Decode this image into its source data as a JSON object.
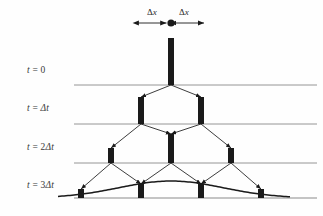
{
  "figure": {
    "kind": "random-walk-binomial-diagram",
    "background_color": "#fefefe",
    "ink_color": "#1a1a1a",
    "gridline_color": "#8a8a8a",
    "label_color": "#3a3a3a"
  },
  "spacing_labels": {
    "left": "Δx",
    "right": "Δx",
    "origin_marker": "filled-dot"
  },
  "time_labels": [
    {
      "id": "t0",
      "text": "t = 0",
      "x": 27,
      "y": 65
    },
    {
      "id": "t1",
      "text": "t = Δt",
      "x": 27,
      "y": 103
    },
    {
      "id": "t2",
      "text": "t = 2Δt",
      "x": 27,
      "y": 142
    },
    {
      "id": "t3",
      "text": "t = 3Δt",
      "x": 27,
      "y": 180
    }
  ],
  "chart_data": {
    "type": "bar",
    "title": "",
    "xlabel": "",
    "ylabel": "",
    "grid": true,
    "legend_position": "none",
    "axis_origin_x": 171,
    "delta_x_pixels": 30,
    "rows": [
      {
        "time": "t = 0",
        "baseline_y": 85,
        "bar_width": 6,
        "bars": [
          {
            "x": 171,
            "height": 47,
            "value": 1.0
          }
        ]
      },
      {
        "time": "t = Δt",
        "baseline_y": 124,
        "bar_width": 6,
        "bars": [
          {
            "x": 141,
            "height": 27,
            "value": 0.5
          },
          {
            "x": 201,
            "height": 27,
            "value": 0.5
          }
        ]
      },
      {
        "time": "t = 2Δt",
        "baseline_y": 163,
        "bar_width": 6,
        "bars": [
          {
            "x": 111,
            "height": 15,
            "value": 0.25
          },
          {
            "x": 171,
            "height": 29,
            "value": 0.5
          },
          {
            "x": 231,
            "height": 15,
            "value": 0.25
          }
        ]
      },
      {
        "time": "t = 3Δt",
        "baseline_y": 198,
        "bar_width": 6,
        "bars": [
          {
            "x": 81,
            "height": 9,
            "value": 0.125
          },
          {
            "x": 141,
            "height": 14,
            "value": 0.375
          },
          {
            "x": 201,
            "height": 14,
            "value": 0.375
          },
          {
            "x": 261,
            "height": 9,
            "value": 0.125
          }
        ]
      }
    ],
    "gridlines_y": [
      85,
      124,
      163,
      198
    ],
    "gridline_x_start": 74,
    "gridline_x_end": 317,
    "envelope_curve": {
      "description": "smooth gaussian envelope over t = 3Δt distribution",
      "peak_x": 171,
      "peak_y": 181,
      "baseline_y": 198
    },
    "transitions": [
      {
        "from_x": 171,
        "from_y": 85,
        "to_x": 141,
        "to_y": 97
      },
      {
        "from_x": 171,
        "from_y": 85,
        "to_x": 201,
        "to_y": 97
      },
      {
        "from_x": 141,
        "from_y": 124,
        "to_x": 111,
        "to_y": 148
      },
      {
        "from_x": 141,
        "from_y": 124,
        "to_x": 171,
        "to_y": 134
      },
      {
        "from_x": 201,
        "from_y": 124,
        "to_x": 171,
        "to_y": 134
      },
      {
        "from_x": 201,
        "from_y": 124,
        "to_x": 231,
        "to_y": 148
      },
      {
        "from_x": 111,
        "from_y": 163,
        "to_x": 81,
        "to_y": 189
      },
      {
        "from_x": 111,
        "from_y": 163,
        "to_x": 141,
        "to_y": 184
      },
      {
        "from_x": 171,
        "from_y": 163,
        "to_x": 141,
        "to_y": 184
      },
      {
        "from_x": 171,
        "from_y": 163,
        "to_x": 201,
        "to_y": 184
      },
      {
        "from_x": 231,
        "from_y": 163,
        "to_x": 201,
        "to_y": 184
      },
      {
        "from_x": 231,
        "from_y": 163,
        "to_x": 261,
        "to_y": 189
      }
    ]
  }
}
